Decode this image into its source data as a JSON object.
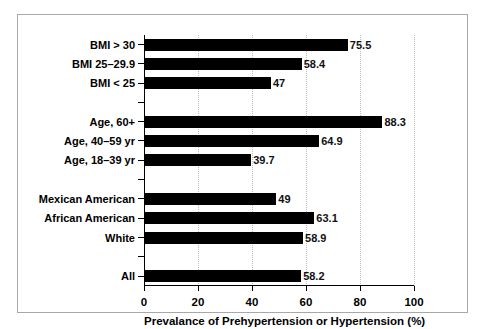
{
  "chart_data": {
    "type": "bar",
    "orientation": "horizontal",
    "title": "",
    "xlabel": "Prevalance of Prehypertension or Hypertension (%)",
    "ylabel": "",
    "xlim": [
      0,
      100
    ],
    "xticks": [
      0,
      20,
      40,
      60,
      80,
      100
    ],
    "xtick_labels": [
      "0",
      "20",
      "40",
      "60",
      "80",
      "100"
    ],
    "grid": "vertical-dotted",
    "legend": "none",
    "bar_color": "#000000",
    "background_color": "#ffffff",
    "categories": [
      "BMI > 30",
      "BMI 25–29.9",
      "BMI < 25",
      "Age, 60+",
      "Age, 40–59 yr",
      "Age, 18–39 yr",
      "Mexican American",
      "African American",
      "White",
      "All"
    ],
    "values": [
      75.5,
      58.4,
      47,
      88.3,
      64.9,
      39.7,
      49,
      63.1,
      58.9,
      58.2
    ],
    "value_labels": [
      "75.5",
      "58.4",
      "47",
      "88.3",
      "64.9",
      "39.7",
      "49",
      "63.1",
      "58.9",
      "58.2"
    ],
    "rows": [
      {
        "kind": "bar",
        "label": "BMI > 30",
        "value": 75.5,
        "value_label": "75.5"
      },
      {
        "kind": "bar",
        "label": "BMI 25–29.9",
        "value": 58.4,
        "value_label": "58.4"
      },
      {
        "kind": "bar",
        "label": "BMI < 25",
        "value": 47,
        "value_label": "47"
      },
      {
        "kind": "spacer",
        "label": "",
        "value": null,
        "value_label": ""
      },
      {
        "kind": "bar",
        "label": "Age, 60+",
        "value": 88.3,
        "value_label": "88.3"
      },
      {
        "kind": "bar",
        "label": "Age, 40–59 yr",
        "value": 64.9,
        "value_label": "64.9"
      },
      {
        "kind": "bar",
        "label": "Age, 18–39 yr",
        "value": 39.7,
        "value_label": "39.7"
      },
      {
        "kind": "spacer",
        "label": "",
        "value": null,
        "value_label": ""
      },
      {
        "kind": "bar",
        "label": "Mexican American",
        "value": 49,
        "value_label": "49"
      },
      {
        "kind": "bar",
        "label": "African American",
        "value": 63.1,
        "value_label": "63.1"
      },
      {
        "kind": "bar",
        "label": "White",
        "value": 58.9,
        "value_label": "58.9"
      },
      {
        "kind": "spacer",
        "label": "",
        "value": null,
        "value_label": ""
      },
      {
        "kind": "bar",
        "label": "All",
        "value": 58.2,
        "value_label": "58.2"
      }
    ],
    "groups": [
      {
        "name": "BMI",
        "members": [
          "BMI > 30",
          "BMI 25–29.9",
          "BMI < 25"
        ]
      },
      {
        "name": "Age",
        "members": [
          "Age, 60+",
          "Age, 40–59 yr",
          "Age, 18–39 yr"
        ]
      },
      {
        "name": "Race/Ethnicity",
        "members": [
          "Mexican American",
          "African American",
          "White"
        ]
      },
      {
        "name": "Overall",
        "members": [
          "All"
        ]
      }
    ]
  }
}
